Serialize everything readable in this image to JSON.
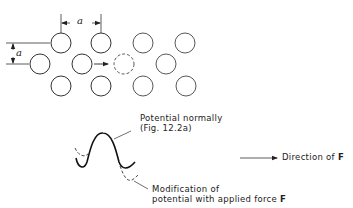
{
  "diagram": {
    "lattice": {
      "spacing_label": "a",
      "vertical_spacing_label": "a",
      "atoms": [
        {
          "x": 61,
          "y": 43,
          "dashed": false
        },
        {
          "x": 101,
          "y": 43,
          "dashed": false
        },
        {
          "x": 143,
          "y": 43,
          "dashed": false
        },
        {
          "x": 185,
          "y": 43,
          "dashed": false
        },
        {
          "x": 40,
          "y": 64,
          "dashed": false
        },
        {
          "x": 82,
          "y": 64,
          "dashed": false
        },
        {
          "x": 124,
          "y": 64,
          "dashed": true
        },
        {
          "x": 166,
          "y": 64,
          "dashed": false
        },
        {
          "x": 61,
          "y": 86,
          "dashed": false
        },
        {
          "x": 101,
          "y": 86,
          "dashed": false
        },
        {
          "x": 143,
          "y": 86,
          "dashed": false
        },
        {
          "x": 186,
          "y": 86,
          "dashed": false
        }
      ]
    },
    "labels": {
      "potential_normally_line1": "Potential normally",
      "potential_normally_line2": "(Fig. 12.2a)",
      "modification_line1": "Modification of",
      "modification_line2": "potential with applied force ",
      "force_symbol": "F",
      "direction_text": "Direction of ",
      "direction_symbol": "F"
    },
    "colors": {
      "stroke": "#333333",
      "background": "#ffffff"
    }
  }
}
